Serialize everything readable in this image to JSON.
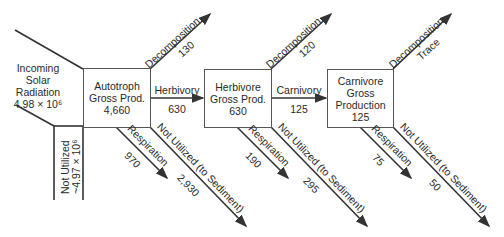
{
  "source": {
    "label_lines": [
      "Incoming",
      "Solar",
      "Radiation"
    ],
    "value": "4.98 × 10⁶",
    "not_utilized_label": "Not Utilized",
    "not_utilized_value": "~4.97 × 10⁶"
  },
  "levels": [
    {
      "name": "Autotroph",
      "box_lines": [
        "Autotroph",
        "Gross Prod."
      ],
      "value": "4,660",
      "decomposition": {
        "label": "Decomposition",
        "value": "130"
      },
      "respiration": {
        "label": "Respiration",
        "value": "970"
      },
      "not_utilized": {
        "label": "Not Utilized (to Sediment)",
        "value": "2,930"
      }
    },
    {
      "name": "Herbivore",
      "box_lines": [
        "Herbivore",
        "Gross Prod."
      ],
      "value": "630",
      "decomposition": {
        "label": "Decomposition",
        "value": "120"
      },
      "respiration": {
        "label": "Respiration",
        "value": "190"
      },
      "not_utilized": {
        "label": "Not Utilized (to Sediment)",
        "value": "295"
      }
    },
    {
      "name": "Carnivore",
      "box_lines": [
        "Carnivore",
        "Gross",
        "Production"
      ],
      "value": "125",
      "decomposition": {
        "label": "Decomposition",
        "value": "Trace"
      },
      "respiration": {
        "label": "Respiration",
        "value": "75"
      },
      "not_utilized": {
        "label": "Not Utilized (to Sediment)",
        "value": "50"
      }
    }
  ],
  "transfers": [
    {
      "label": "Herbivory",
      "value": "630"
    },
    {
      "label": "Carnivory",
      "value": "125"
    }
  ],
  "colors": {
    "line": "#333333",
    "text": "#2a2a2a",
    "background": "#ffffff"
  }
}
